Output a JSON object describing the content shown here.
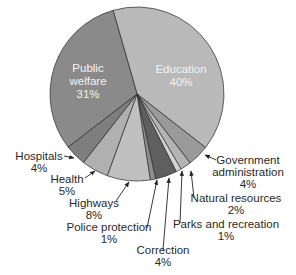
{
  "chart_data": {
    "type": "pie",
    "title": "",
    "start_angle_deg": 344,
    "direction": "clockwise",
    "center": [
      137,
      94
    ],
    "radius": 87,
    "slices": [
      {
        "label": "Education",
        "value": 40,
        "text": "40%",
        "color": "#b9b9b9",
        "inside": true,
        "lx": 181,
        "ly": 70
      },
      {
        "label": "Government administration",
        "value": 4,
        "text": "4%",
        "color": "#9a9a9a"
      },
      {
        "label": "Natural resources",
        "value": 2,
        "text": "2%",
        "color": "#b4b4b4"
      },
      {
        "label": "Parks and recreation",
        "value": 1,
        "text": "1%",
        "color": "#d3d3d3"
      },
      {
        "label": "Correction",
        "value": 4,
        "text": "4%",
        "color": "#5f5f5f"
      },
      {
        "label": "Police protection",
        "value": 1,
        "text": "1%",
        "color": "#8e8e8e"
      },
      {
        "label": "Highways",
        "value": 8,
        "text": "8%",
        "color": "#c0c0c0"
      },
      {
        "label": "Health",
        "value": 5,
        "text": "5%",
        "color": "#b0b0b0"
      },
      {
        "label": "Hospitals",
        "value": 4,
        "text": "4%",
        "color": "#7e7e7e"
      },
      {
        "label": "Public welfare",
        "value": 31,
        "text": "31%",
        "color": "#8a8a8a",
        "inside": true,
        "lx": 88,
        "ly": 70
      }
    ],
    "categories": [
      "Education",
      "Government administration",
      "Natural resources",
      "Parks and recreation",
      "Correction",
      "Police protection",
      "Highways",
      "Health",
      "Hospitals",
      "Public welfare"
    ],
    "values": [
      40,
      4,
      2,
      1,
      4,
      1,
      8,
      5,
      4,
      31
    ]
  },
  "labels": {
    "education": {
      "line1": "Education",
      "line2": "40%"
    },
    "public_welfare": {
      "line1": "Public",
      "line2": "welfare",
      "line3": "31%"
    },
    "hospitals": {
      "line1": "Hospitals",
      "line2": "4%"
    },
    "health": {
      "line1": "Health",
      "line2": "5%"
    },
    "highways": {
      "line1": "Highways",
      "line2": "8%"
    },
    "police": {
      "line1": "Police protection",
      "line2": "1%"
    },
    "correction": {
      "line1": "Correction",
      "line2": "4%"
    },
    "parks": {
      "line1": "Parks and recreation",
      "line2": "1%"
    },
    "natural": {
      "line1": "Natural resources",
      "line2": "2%"
    },
    "government": {
      "line1": "Government",
      "line2": "administration",
      "line3": "4%"
    }
  }
}
